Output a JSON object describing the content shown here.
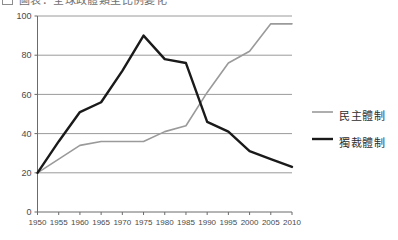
{
  "caption": {
    "marker_icon": "square-outline-icon",
    "text": "圖表：全球政體類型比例變化"
  },
  "chart_data": {
    "type": "line",
    "title": "",
    "subtitle": "",
    "xlabel": "",
    "ylabel": "",
    "x": [
      1950,
      1955,
      1960,
      1965,
      1970,
      1975,
      1980,
      1985,
      1990,
      1995,
      2000,
      2005,
      2010
    ],
    "categories": [
      "1950",
      "1955",
      "1960",
      "1965",
      "1970",
      "1975",
      "1980",
      "1985",
      "1990",
      "1995",
      "2000",
      "2005",
      "2010"
    ],
    "xlim": [
      1950,
      2010
    ],
    "ylim": [
      0,
      100
    ],
    "yticks": [
      0,
      20,
      40,
      60,
      80,
      100
    ],
    "ytick_labels": [
      "0",
      "20",
      "40",
      "60",
      "80",
      "100"
    ],
    "grid": "horizontal",
    "legend_position": "right",
    "series": [
      {
        "name": "民主體制",
        "color": "#9a9a9a",
        "width": 1.6,
        "values": [
          20,
          27,
          34,
          36,
          36,
          36,
          41,
          44,
          61,
          76,
          82,
          96,
          96
        ]
      },
      {
        "name": "獨裁體制",
        "color": "#1a1a1a",
        "width": 2.4,
        "values": [
          20,
          36,
          51,
          56,
          72,
          90,
          78,
          76,
          46,
          41,
          31,
          27,
          23
        ]
      }
    ]
  },
  "legend": {
    "items": [
      {
        "label": "民主體制",
        "swatch_name": "legend-swatch-democracy"
      },
      {
        "label": "獨裁體制",
        "swatch_name": "legend-swatch-autocracy"
      }
    ]
  },
  "colors": {
    "democracy": "#9a9a9a",
    "autocracy": "#1a1a1a",
    "grid": "#8e8e8e",
    "axis": "#6b6b6b",
    "text": "#4a4a4a"
  }
}
